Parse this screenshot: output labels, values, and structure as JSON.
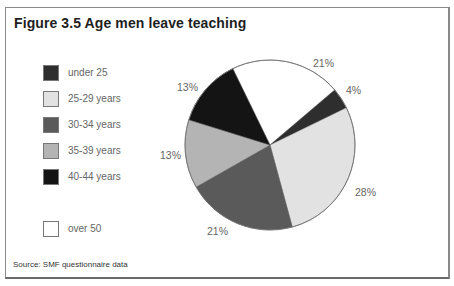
{
  "figure": {
    "title": "Figure 3.5 Age men leave teaching",
    "source": "Source: SMF questionnaire data"
  },
  "legend": [
    {
      "label": "under 25",
      "color": "#2e2e2e"
    },
    {
      "label": "25-29 years",
      "color": "#e2e2e2"
    },
    {
      "label": "30-34 years",
      "color": "#5a5a5a"
    },
    {
      "label": "35-39 years",
      "color": "#b4b4b4"
    },
    {
      "label": "40-44 years",
      "color": "#141414"
    },
    {
      "label": "over 50",
      "color": "#ffffff"
    }
  ],
  "labels": {
    "over50": "21%",
    "under25": "4%",
    "y25_29": "28%",
    "y30_34": "21%",
    "y35_39": "13%",
    "y40_44": "13%"
  },
  "chart_data": {
    "type": "pie",
    "title": "Figure 3.5 Age men leave teaching",
    "categories": [
      "over 50",
      "under 25",
      "25-29 years",
      "30-34 years",
      "35-39 years",
      "40-44 years"
    ],
    "values": [
      21,
      4,
      28,
      21,
      13,
      13
    ],
    "unit": "%",
    "colors": [
      "#ffffff",
      "#2e2e2e",
      "#e2e2e2",
      "#5a5a5a",
      "#b4b4b4",
      "#141414"
    ],
    "start_angle_deg_clockwise_from_top": 334,
    "legend_position": "left",
    "legend_entries": [
      "under 25",
      "25-29 years",
      "30-34 years",
      "35-39 years",
      "40-44 years",
      "over 50"
    ],
    "source": "Source: SMF questionnaire data"
  }
}
